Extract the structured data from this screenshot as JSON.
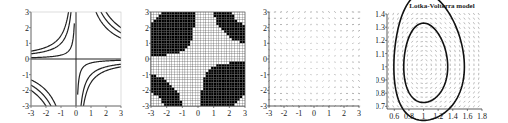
{
  "figure": {
    "panels": [
      {
        "id": "p1",
        "kind": "contour",
        "x_ticks": [
          "-3",
          "-2",
          "-1",
          "0",
          "1",
          "2",
          "3"
        ],
        "y_ticks": [
          "3",
          "2",
          "1",
          "0",
          "-1",
          "-2",
          "-3"
        ]
      },
      {
        "id": "p2",
        "kind": "binary-grid",
        "x_ticks": [
          "-3",
          "-2",
          "-1",
          "0",
          "1",
          "2",
          "3"
        ],
        "y_ticks": [
          "3",
          "2",
          "1",
          "0",
          "-1",
          "-2",
          "-3"
        ]
      },
      {
        "id": "p3",
        "kind": "vector-field",
        "x_ticks": [
          "-3",
          "-2",
          "-1",
          "0",
          "1",
          "2",
          "3"
        ],
        "y_ticks": [
          "3",
          "2",
          "1",
          "0",
          "-1",
          "-2",
          "-3"
        ]
      },
      {
        "id": "p4",
        "kind": "phase-portrait",
        "title": "Lotka-Volterra model",
        "x_ticks": [
          "0.6",
          "0.8",
          "1",
          "1.2",
          "1.4",
          "1.6",
          "1.8"
        ],
        "y_ticks": [
          "1.4",
          "1.3",
          "1.2",
          "1.1",
          "1",
          "0.9",
          "0.8",
          "0.7"
        ]
      }
    ]
  },
  "chart_data": [
    {
      "type": "contour",
      "title": "",
      "function_hint": "level sets of x*y (hyperbolas)",
      "xlim": [
        -3,
        3
      ],
      "ylim": [
        -3,
        3
      ],
      "x_ticks": [
        -3,
        -2,
        -1,
        0,
        1,
        2,
        3
      ],
      "y_ticks": [
        -3,
        -2,
        -1,
        0,
        1,
        2,
        3
      ],
      "levels": [
        0.25,
        1,
        1.5,
        4,
        5,
        6
      ],
      "grid": false
    },
    {
      "type": "heatmap",
      "title": "",
      "description": "binary black/white grid showing sign pattern of a function of x,y on a fine mesh",
      "xlim": [
        -3,
        3
      ],
      "ylim": [
        -3,
        3
      ],
      "x_ticks": [
        -3,
        -2,
        -1,
        0,
        1,
        2,
        3
      ],
      "y_ticks": [
        -3,
        -2,
        -1,
        0,
        1,
        2,
        3
      ],
      "grid": true
    },
    {
      "type": "vector-field",
      "title": "",
      "xlim": [
        -3,
        3
      ],
      "ylim": [
        -3,
        3
      ],
      "x_ticks": [
        -3,
        -2,
        -1,
        0,
        1,
        2,
        3
      ],
      "y_ticks": [
        -3,
        -2,
        -1,
        0,
        1,
        2,
        3
      ],
      "grid_spacing": 0.4
    },
    {
      "type": "vector-field",
      "title": "Lotka-Volterra model",
      "xlim": [
        0.5,
        1.8
      ],
      "ylim": [
        0.68,
        1.4
      ],
      "x_ticks": [
        0.6,
        0.8,
        1,
        1.2,
        1.4,
        1.6,
        1.8
      ],
      "y_ticks": [
        0.7,
        0.8,
        0.9,
        1,
        1.1,
        1.2,
        1.3,
        1.4
      ],
      "equilibrium": [
        1,
        1
      ],
      "orbits": [
        {
          "name": "outer orbit",
          "x_range": [
            0.53,
            1.75
          ],
          "y_range": [
            0.71,
            1.37
          ]
        },
        {
          "name": "inner orbit",
          "x_range": [
            0.67,
            1.5
          ],
          "y_range": [
            0.8,
            1.22
          ]
        }
      ]
    }
  ]
}
